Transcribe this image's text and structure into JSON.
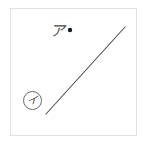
{
  "figure": {
    "background_color": "#ffffff",
    "frame": {
      "border_color": "#e2e2e2",
      "fill_color": "#ffffff"
    },
    "line_segment": {
      "color": "#4d4d4d",
      "stroke_width": 1.1,
      "x1": 46,
      "y1": 114,
      "x2": 125,
      "y2": 27
    },
    "point": {
      "label": "",
      "color": "#1a1a1a",
      "cx": 70,
      "cy": 30,
      "r": 2.2
    },
    "labels": {
      "point_label": "ア",
      "line_label": "イ",
      "line_label_circle_color": "#6b6b6b"
    }
  }
}
